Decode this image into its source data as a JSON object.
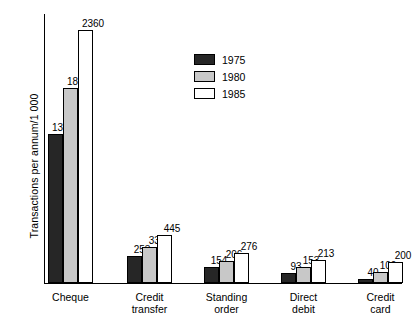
{
  "chart_data": {
    "type": "bar",
    "title": "",
    "xlabel": "",
    "ylabel": "Transactions per annum/1 000",
    "categories": [
      "Cheque",
      "Credit\ntransfer",
      "Standing\norder",
      "Direct\ndebit",
      "Credit\ncard"
    ],
    "series": [
      {
        "name": "1975",
        "color": "#262626",
        "values": [
          1386,
          253,
          154,
          93,
          40
        ]
      },
      {
        "name": "1980",
        "color": "#c8c8c8",
        "values": [
          1820,
          334,
          206,
          153,
          100
        ]
      },
      {
        "name": "1985",
        "color": "#ffffff",
        "values": [
          2360,
          445,
          276,
          213,
          200
        ]
      }
    ],
    "ylim": [
      0,
      2510
    ],
    "grid": false,
    "data_labels": true,
    "legend_position": "top-center"
  },
  "legend": {
    "items": [
      {
        "label": "1975",
        "swatch": "dark-swatch"
      },
      {
        "label": "1980",
        "swatch": "gray-swatch"
      },
      {
        "label": "1985",
        "swatch": "white-swatch"
      }
    ]
  }
}
